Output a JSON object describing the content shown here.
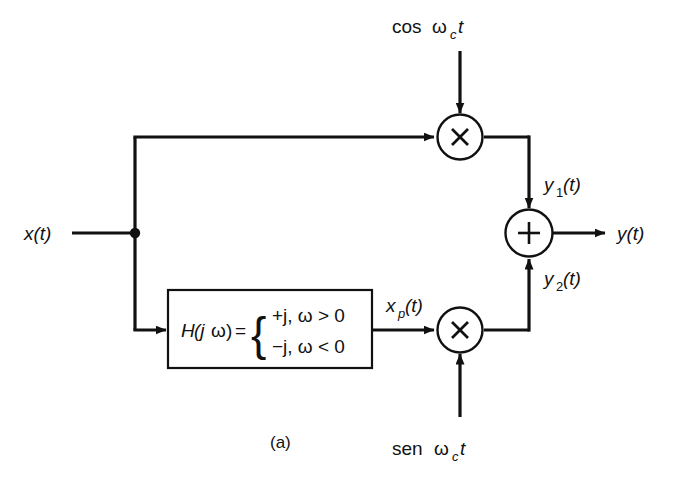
{
  "figure": {
    "caption": "(a)"
  },
  "signals": {
    "input_label": "x(t)",
    "output_label": "y(t)",
    "hilbert_output_label_base": "x",
    "hilbert_output_label_sub": "p",
    "hilbert_output_label_tail": "(t)",
    "upper_branch_label_base": "y",
    "upper_branch_label_sub": "1",
    "upper_branch_label_tail": "(t)",
    "lower_branch_label_base": "y",
    "lower_branch_label_sub": "2",
    "lower_branch_label_tail": "(t)"
  },
  "carriers": {
    "top_prefix": "cos",
    "top_omega": "ω",
    "top_sub": "c",
    "top_var": "t",
    "bottom_prefix": "sen",
    "bottom_omega": "ω",
    "bottom_sub": "c",
    "bottom_var": "t"
  },
  "filter_block": {
    "name": "H",
    "arg_open": "(j",
    "arg_omega": "ω",
    "arg_close": ")",
    "equals": "=",
    "brace": "{",
    "case_top": "+j, ω > 0",
    "case_bottom": "−j, ω < 0"
  },
  "operators": {
    "multiplier_top": "×",
    "multiplier_bottom": "×",
    "adder": "+"
  },
  "colors": {
    "ink": "#111111",
    "paper": "#ffffff"
  }
}
